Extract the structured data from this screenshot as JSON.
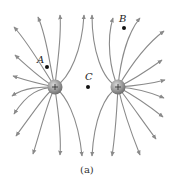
{
  "figure": {
    "caption": "(a)",
    "charges": [
      {
        "id": "left",
        "sign": "+",
        "cx": 55,
        "cy": 87
      },
      {
        "id": "right",
        "sign": "+",
        "cx": 118,
        "cy": 87
      }
    ],
    "points": [
      {
        "label": "A",
        "x": 47,
        "y": 67
      },
      {
        "label": "B",
        "x": 124,
        "y": 28
      },
      {
        "label": "C",
        "x": 88,
        "y": 87
      }
    ],
    "colors": {
      "field_line": "#8a8a8a",
      "charge_fill": "#9a9a9a",
      "dot": "#111111"
    }
  }
}
